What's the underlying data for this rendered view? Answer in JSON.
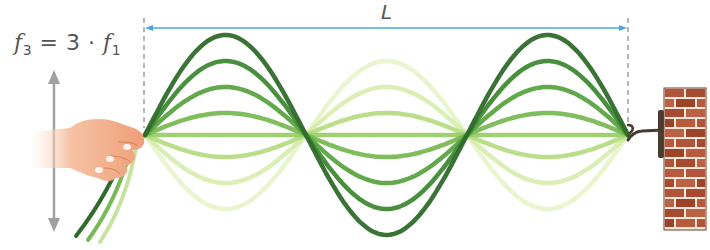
{
  "diagram": {
    "formula": {
      "lhs_symbol": "f",
      "lhs_sub": "3",
      "equals": "=",
      "factor": "3",
      "dot": "·",
      "rhs_symbol": "f",
      "rhs_sub": "1"
    },
    "length_label": "L",
    "harmonic": 3,
    "nodes_count": 4,
    "antinodes_count": 3,
    "string": {
      "x_start": 145,
      "x_end": 628,
      "center_y": 135,
      "max_amplitude": 100
    },
    "curve_amplitudes": [
      100,
      74,
      48,
      22,
      0,
      -22,
      -48,
      -74
    ],
    "curve_colors": [
      "#2f6b2a",
      "#3f8a34",
      "#5aa441",
      "#79b954",
      "#9ccc6b",
      "#b6dc84",
      "#cde89e",
      "#e2f2bd"
    ],
    "colors": {
      "dimension_line": "#4aa8e0",
      "dashed_guide": "#888888",
      "arrow": "#a0a0a0",
      "hand": "#f2a880",
      "brick": "#b0553a",
      "mortar": "#f0e6dc",
      "hook": "#4a3a30",
      "text": "#555555"
    },
    "elements": {
      "hand_label": "hand holding string end",
      "wall_label": "brick wall with hook",
      "motion_arrow_label": "vertical oscillation arrow"
    }
  }
}
